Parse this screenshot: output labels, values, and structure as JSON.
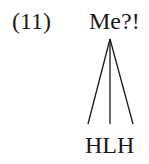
{
  "example": {
    "number": "(11)",
    "utterance": "Me?!",
    "tones": "HLH",
    "association_lines": 3
  },
  "colors": {
    "text": "#1a1a1a",
    "background": "#ffffff"
  }
}
